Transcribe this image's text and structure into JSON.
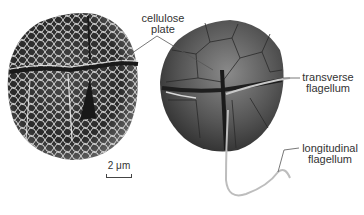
{
  "figure": {
    "panels": [
      {
        "name": "sem-micrograph",
        "description": "scanning electron micrograph of cell with reticulate cellulose plates"
      },
      {
        "name": "illustration",
        "description": "drawing of cell showing plates and flagella"
      }
    ],
    "labels": {
      "cellulose_plate": {
        "line1": "cellulose",
        "line2": "plate"
      },
      "transverse_flagellum": {
        "line1": "transverse",
        "line2": "flagellum"
      },
      "longitudinal_flagellum": {
        "line1": "longitudinal",
        "line2": "flagellum"
      }
    },
    "scale_bar": {
      "label": "2 μm"
    },
    "colors": {
      "background": "#ffffff",
      "cell_dark": "#2e2e2e",
      "cell_mid": "#5a5a5a",
      "plate_line": "#e8e8e8",
      "label_text": "#333333",
      "leader_line": "#555555"
    }
  }
}
